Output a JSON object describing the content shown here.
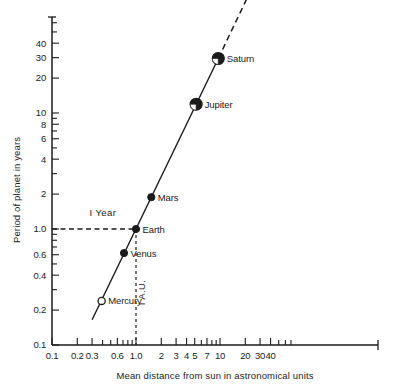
{
  "chart_data": {
    "type": "scatter",
    "title": "",
    "xlabel": "Mean distance from sun in astronomical units",
    "ylabel": "Period of planet in years",
    "xscale": "log",
    "yscale": "log",
    "xlim": [
      0.1,
      70
    ],
    "ylim": [
      0.1,
      60
    ],
    "grid": false,
    "legend": "none",
    "xtick_labels": [
      "0.1",
      "0.2",
      "0.3",
      "0.6",
      "1.0",
      "2",
      "3",
      "4",
      "5",
      "7",
      "10",
      "20",
      "30",
      "40"
    ],
    "xtick_values": [
      0.1,
      0.2,
      0.3,
      0.6,
      1.0,
      2,
      3,
      4,
      5,
      7,
      10,
      20,
      30,
      40
    ],
    "ytick_labels": [
      "0.1",
      "0.2",
      "0.4",
      "0.6",
      "1.0",
      "2",
      "4",
      "6",
      "8",
      "10",
      "20",
      "30",
      "40"
    ],
    "ytick_values": [
      0.1,
      0.2,
      0.4,
      0.6,
      1.0,
      2,
      4,
      6,
      8,
      10,
      20,
      30,
      40
    ],
    "points": [
      {
        "name": "Mercury",
        "x": 0.39,
        "y": 0.24,
        "marker": "open-circle",
        "size": "small",
        "label_side": "right"
      },
      {
        "name": "Venus",
        "x": 0.72,
        "y": 0.62,
        "marker": "filled-circle",
        "size": "small",
        "label_side": "right"
      },
      {
        "name": "Earth",
        "x": 1.0,
        "y": 1.0,
        "marker": "filled-circle",
        "size": "small",
        "label_side": "right"
      },
      {
        "name": "Mars",
        "x": 1.52,
        "y": 1.88,
        "marker": "filled-circle",
        "size": "small",
        "label_side": "right"
      },
      {
        "name": "Jupiter",
        "x": 5.2,
        "y": 11.9,
        "marker": "half-circle",
        "size": "large",
        "label_side": "right"
      },
      {
        "name": "Saturn",
        "x": 9.54,
        "y": 29.5,
        "marker": "half-circle",
        "size": "large",
        "label_side": "right"
      }
    ],
    "fit_line": {
      "style": "solid",
      "from": {
        "x": 0.3,
        "y": 0.165
      },
      "to": {
        "x": 9.54,
        "y": 29.5
      },
      "note": "Kepler third law slope 1.5 on log-log axes"
    },
    "fit_line_extension": {
      "style": "dashed",
      "from": {
        "x": 9.54,
        "y": 29.5
      },
      "to": {
        "x": 22,
        "y": 105
      }
    },
    "annotations": [
      {
        "id": "one-year",
        "text": "I Year",
        "kind": "guide-label",
        "x": 0.28,
        "y": 1.3
      },
      {
        "id": "one-au",
        "text": "I A.U.",
        "kind": "guide-label-vertical",
        "x": 1.08,
        "y": 0.22
      }
    ],
    "guides": [
      {
        "id": "year-guide",
        "orientation": "horizontal",
        "value": 1.0,
        "style": "dashed",
        "from_x": 0.1,
        "to_x": 1.0
      },
      {
        "id": "au-guide",
        "orientation": "vertical",
        "value": 1.0,
        "style": "dashed",
        "from_y": 0.1,
        "to_y": 1.0
      }
    ],
    "colors": {
      "axis": "#1b1b1b",
      "line": "#1b1b1b",
      "marker_fill": "#1b1b1b",
      "marker_stroke": "#1b1b1b",
      "background": "#ffffff"
    }
  }
}
